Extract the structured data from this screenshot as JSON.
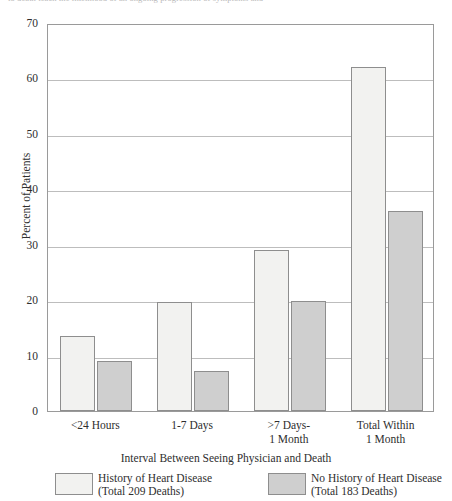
{
  "top_clipped_caption": "to death teach the likelihood of an ongoing progression of symptoms and",
  "chart_data": {
    "type": "bar",
    "title": "",
    "xlabel": "Interval Between Seeing Physician and Death",
    "ylabel": "Percent of Patients",
    "ylim": [
      0,
      70
    ],
    "ytick_step": 10,
    "yticks": [
      "0",
      "10",
      "20",
      "30",
      "40",
      "50",
      "60",
      "70"
    ],
    "grid": true,
    "legend_position": "bottom",
    "categories": [
      "<24 Hours",
      "1-7 Days",
      ">7 Days-\n1 Month",
      "Total Within\n1 Month"
    ],
    "category_lines": [
      [
        "<24 Hours"
      ],
      [
        "1-7 Days"
      ],
      [
        ">7 Days-",
        "1 Month"
      ],
      [
        "Total Within",
        "1 Month"
      ]
    ],
    "series": [
      {
        "name": "History of Heart Disease",
        "sublabel": "(Total 209 Deaths)",
        "color": "#f2f2f0",
        "values": [
          13.5,
          19.7,
          29.0,
          62.0
        ]
      },
      {
        "name": "No History of Heart Disease",
        "sublabel": "(Total 183 Deaths)",
        "color": "#cfcfcf",
        "values": [
          9.0,
          7.2,
          19.8,
          36.0
        ]
      }
    ]
  },
  "colors": {
    "series_a": "#f2f2f0",
    "series_b": "#cfcfcf",
    "bar_border": "#8e8e8e",
    "gridline": "#bdbdbd",
    "frame": "#9a9a9a",
    "text": "#2e2e2e",
    "background": "#ffffff"
  }
}
